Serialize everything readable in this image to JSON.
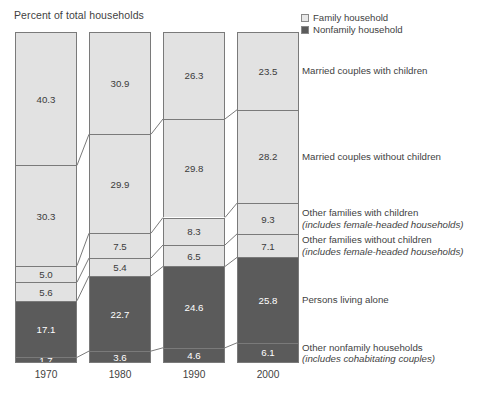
{
  "axis_title": "Percent of total households",
  "legend": {
    "items": [
      {
        "label": "Family household",
        "swatch": "#e2e2e2",
        "icon": "legend-square-light"
      },
      {
        "label": "Nonfamily household",
        "swatch": "#5b5b5b",
        "icon": "legend-square-dark"
      }
    ]
  },
  "colors": {
    "family": "#e2e2e2",
    "nonfamily": "#5b5b5b",
    "outline": "#7a7a7a",
    "text": "#3f3f3f"
  },
  "categories_labels": [
    {
      "title": "Married couples with children",
      "subtitle": ""
    },
    {
      "title": "Married couples without children",
      "subtitle": ""
    },
    {
      "title": "Other families with children",
      "subtitle": "(includes female-headed households)"
    },
    {
      "title": "Other families without children",
      "subtitle": "(includes female-headed households)"
    },
    {
      "title": "Persons living alone",
      "subtitle": ""
    },
    {
      "title": "Other nonfamily households",
      "subtitle": "(includes cohabitating couples)"
    }
  ],
  "chart_data": {
    "type": "bar",
    "subtype": "stacked-100-percent",
    "title": "",
    "xlabel": "",
    "ylabel": "Percent of total households",
    "ylim": [
      0,
      100
    ],
    "grid": false,
    "legend_position": "top-right",
    "categories": [
      "1970",
      "1980",
      "1990",
      "2000"
    ],
    "series": [
      {
        "name": "Married couples with children",
        "group": "Family household",
        "values": [
          40.3,
          30.9,
          26.3,
          23.5
        ]
      },
      {
        "name": "Married couples without children",
        "group": "Family household",
        "values": [
          30.3,
          29.9,
          29.8,
          28.2
        ]
      },
      {
        "name": "Other families with children",
        "group": "Family household",
        "values": [
          5.0,
          7.5,
          8.3,
          9.3
        ]
      },
      {
        "name": "Other families without children",
        "group": "Family household",
        "values": [
          5.6,
          5.4,
          6.5,
          7.1
        ]
      },
      {
        "name": "Persons living alone",
        "group": "Nonfamily household",
        "values": [
          17.1,
          22.7,
          24.6,
          25.8
        ]
      },
      {
        "name": "Other nonfamily households",
        "group": "Nonfamily household",
        "values": [
          1.7,
          3.6,
          4.6,
          6.1
        ]
      }
    ]
  }
}
